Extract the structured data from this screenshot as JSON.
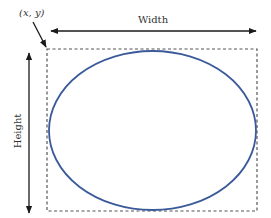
{
  "diagram": {
    "corner_label": "(x, y)",
    "width_label": "Width",
    "height_label": "Height",
    "colors": {
      "ellipse_stroke": "#3a5a9a",
      "arrow": "#1a1a1a",
      "bounding_box": "#555555",
      "text": "#333333"
    },
    "elements": {
      "bounding_box": {
        "x": 47,
        "y": 49,
        "width": 210,
        "height": 162,
        "style": "dashed"
      },
      "ellipse": {
        "cx": 152.5,
        "cy": 130.5,
        "rx": 103.5,
        "ry": 79.5
      },
      "width_arrow": {
        "x1": 51,
        "x2": 256,
        "y": 31,
        "direction": "both"
      },
      "height_arrow": {
        "x": 29,
        "y1": 53,
        "y2": 213,
        "direction": "both"
      },
      "corner_pointer": {
        "from": [
          33,
          22
        ],
        "to": [
          47,
          48
        ]
      }
    }
  }
}
